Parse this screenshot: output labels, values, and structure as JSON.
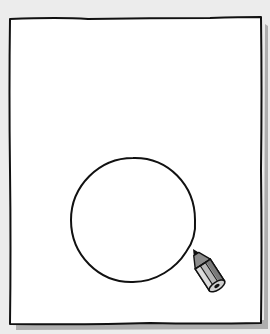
{
  "illustration": {
    "description": "Hand-drawn sheet of paper with a circle being drawn by a pencil",
    "colors": {
      "background": "#ececec",
      "paper": "#ffffff",
      "outline": "#111111",
      "shadow": "#8a8a8a",
      "pencil_body": "#b8b8b8",
      "pencil_dark": "#6e6e6e",
      "pencil_light": "#dcdcdc"
    },
    "paper": {
      "x": 9,
      "y": 18,
      "width": 252,
      "height": 307
    },
    "circle": {
      "cx": 133,
      "cy": 220,
      "r": 62
    },
    "pencil": {
      "tip_x": 193,
      "tip_y": 248,
      "angle_deg": -33
    }
  }
}
